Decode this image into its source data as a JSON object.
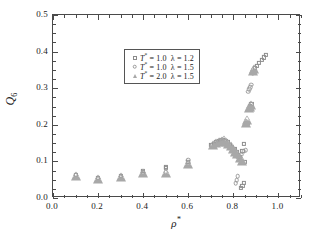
{
  "chart_data": {
    "type": "scatter",
    "title": "",
    "xlabel": "ρ*",
    "ylabel": "Q6",
    "xlim": [
      0.0,
      1.1
    ],
    "ylim": [
      0.0,
      0.5
    ],
    "xticks": [
      0.0,
      0.2,
      0.4,
      0.6,
      0.8,
      1.0
    ],
    "xticklabels": [
      "0.0",
      "0.2",
      "0.4",
      "0.6",
      "0.8",
      "1.0"
    ],
    "yticks": [
      0.0,
      0.1,
      0.2,
      0.3,
      0.4,
      0.5
    ],
    "yticklabels": [
      "0.0",
      "0.1",
      "0.2",
      "0.3",
      "0.4",
      "0.5"
    ],
    "xminor_step": 0.05,
    "yminor_step": 0.025,
    "grid": false,
    "legend_position": "upper left",
    "series": [
      {
        "name": "T* = 1.0  λ = 1.2",
        "marker": "square",
        "color": "#8d8d8d",
        "points": [
          [
            0.1,
            0.063
          ],
          [
            0.2,
            0.055
          ],
          [
            0.3,
            0.06
          ],
          [
            0.4,
            0.07
          ],
          [
            0.4,
            0.074
          ],
          [
            0.5,
            0.086
          ],
          [
            0.5,
            0.083
          ],
          [
            0.6,
            0.098
          ],
          [
            0.7,
            0.145
          ],
          [
            0.715,
            0.148
          ],
          [
            0.725,
            0.152
          ],
          [
            0.735,
            0.155
          ],
          [
            0.745,
            0.158
          ],
          [
            0.755,
            0.159
          ],
          [
            0.765,
            0.157
          ],
          [
            0.775,
            0.152
          ],
          [
            0.785,
            0.146
          ],
          [
            0.795,
            0.14
          ],
          [
            0.805,
            0.133
          ],
          [
            0.815,
            0.125
          ],
          [
            0.82,
            0.118
          ],
          [
            0.83,
            0.112
          ],
          [
            0.84,
            0.128
          ],
          [
            0.845,
            0.148
          ],
          [
            0.85,
            0.098
          ],
          [
            0.845,
            0.042
          ],
          [
            0.84,
            0.033
          ],
          [
            0.835,
            0.028
          ],
          [
            0.86,
            0.2
          ],
          [
            0.865,
            0.205
          ],
          [
            0.875,
            0.252
          ],
          [
            0.88,
            0.258
          ],
          [
            0.885,
            0.345
          ],
          [
            0.895,
            0.355
          ],
          [
            0.905,
            0.362
          ],
          [
            0.915,
            0.37
          ],
          [
            0.925,
            0.378
          ],
          [
            0.935,
            0.384
          ],
          [
            0.945,
            0.39
          ]
        ]
      },
      {
        "name": "T* = 1.0  λ = 1.5",
        "marker": "circle",
        "color": "#9b9b9b",
        "points": [
          [
            0.1,
            0.062
          ],
          [
            0.2,
            0.053
          ],
          [
            0.3,
            0.058
          ],
          [
            0.4,
            0.068
          ],
          [
            0.5,
            0.07
          ],
          [
            0.6,
            0.095
          ],
          [
            0.6,
            0.103
          ],
          [
            0.705,
            0.144
          ],
          [
            0.72,
            0.149
          ],
          [
            0.73,
            0.153
          ],
          [
            0.74,
            0.156
          ],
          [
            0.75,
            0.158
          ],
          [
            0.76,
            0.157
          ],
          [
            0.77,
            0.15
          ],
          [
            0.78,
            0.144
          ],
          [
            0.79,
            0.137
          ],
          [
            0.8,
            0.13
          ],
          [
            0.81,
            0.122
          ],
          [
            0.815,
            0.114
          ],
          [
            0.825,
            0.108
          ],
          [
            0.82,
            0.06
          ],
          [
            0.815,
            0.048
          ],
          [
            0.81,
            0.04
          ],
          [
            0.835,
            0.118
          ],
          [
            0.845,
            0.128
          ],
          [
            0.855,
            0.13
          ],
          [
            0.865,
            0.29
          ],
          [
            0.87,
            0.298
          ],
          [
            0.875,
            0.302
          ],
          [
            0.88,
            0.31
          ],
          [
            0.885,
            0.34
          ]
        ]
      },
      {
        "name": "T* = 2.0  λ = 1.5",
        "marker": "triangle",
        "color": "#a8a8a8",
        "points": [
          [
            0.1,
            0.06
          ],
          [
            0.2,
            0.052
          ],
          [
            0.3,
            0.057
          ],
          [
            0.4,
            0.067
          ],
          [
            0.5,
            0.069
          ],
          [
            0.6,
            0.094
          ],
          [
            0.71,
            0.146
          ],
          [
            0.725,
            0.151
          ],
          [
            0.738,
            0.154
          ],
          [
            0.748,
            0.157
          ],
          [
            0.758,
            0.158
          ],
          [
            0.768,
            0.154
          ],
          [
            0.778,
            0.148
          ],
          [
            0.788,
            0.141
          ],
          [
            0.798,
            0.134
          ],
          [
            0.808,
            0.126
          ],
          [
            0.818,
            0.119
          ],
          [
            0.828,
            0.11
          ],
          [
            0.838,
            0.102
          ],
          [
            0.855,
            0.205
          ],
          [
            0.86,
            0.212
          ],
          [
            0.87,
            0.245
          ],
          [
            0.875,
            0.25
          ],
          [
            0.88,
            0.255
          ],
          [
            0.885,
            0.348
          ],
          [
            0.89,
            0.352
          ]
        ]
      }
    ]
  },
  "axis": {
    "ylabel_main": "Q",
    "ylabel_sub": "6",
    "xlabel_rho": "ρ",
    "xlabel_star": "*"
  },
  "legend": {
    "items": [
      {
        "t_label": "T",
        "t_star": "*",
        "t_eq": "= 1.0",
        "lam": "λ = 1.2"
      },
      {
        "t_label": "T",
        "t_star": "*",
        "t_eq": "= 1.0",
        "lam": "λ = 1.5"
      },
      {
        "t_label": "T",
        "t_star": "*",
        "t_eq": "= 2.0",
        "lam": "λ = 1.5"
      }
    ]
  }
}
